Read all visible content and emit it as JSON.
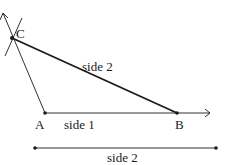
{
  "diagram": {
    "points": {
      "A": {
        "label": "A"
      },
      "B": {
        "label": "B"
      },
      "C": {
        "label": "C"
      }
    },
    "segments": {
      "ab_label": "side 1",
      "bc_label": "side 2",
      "reference_label": "side 2"
    },
    "colors": {
      "ink": "#1a1a1a",
      "background": "#ffffff"
    }
  }
}
